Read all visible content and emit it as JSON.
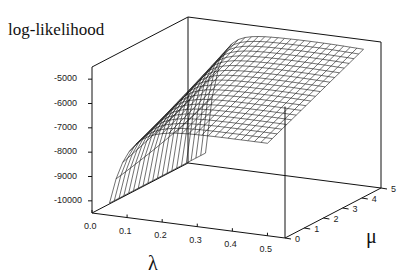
{
  "chart_data": {
    "type": "surface3d",
    "title": "",
    "zlabel": "log-likelihood",
    "xlabel": "λ",
    "ylabel": "μ",
    "x_ticks": [
      "0.0",
      "0.1",
      "0.2",
      "0.3",
      "0.4",
      "0.5"
    ],
    "y_ticks": [
      "0",
      "1",
      "2",
      "3",
      "4",
      "5"
    ],
    "z_ticks": [
      "-5000",
      "-6000",
      "-7000",
      "-8000",
      "-9000",
      "-10000"
    ],
    "xlim": [
      0.0,
      0.55
    ],
    "ylim": [
      0,
      5
    ],
    "zlim": [
      -10500,
      -4500
    ],
    "surface_description": "Wireframe surface: log-likelihood rises steeply from about -10000 near λ≈0.05 to a plateau near -5000 to -4800 for λ>0.2 across μ 0..5; maximum ridge around λ≈0.3-0.4.",
    "profile_at_mu0": {
      "lambda": [
        0.05,
        0.07,
        0.1,
        0.15,
        0.2,
        0.3,
        0.4,
        0.5
      ],
      "loglik": [
        -10000,
        -8500,
        -7600,
        -7100,
        -6900,
        -6800,
        -6700,
        -6700
      ]
    },
    "profile_at_mu5": {
      "lambda": [
        0.05,
        0.1,
        0.15,
        0.2,
        0.3,
        0.4,
        0.5
      ],
      "loglik": [
        -6500,
        -5500,
        -5100,
        -4950,
        -4850,
        -4850,
        -4900
      ]
    }
  },
  "labels": {
    "z": "log-likelihood",
    "x": "λ",
    "y": "μ"
  }
}
